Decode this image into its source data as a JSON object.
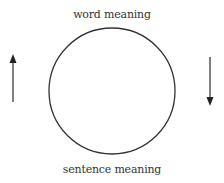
{
  "diagram": {
    "top_label": "word meaning",
    "bottom_label": "sentence meaning",
    "circle": {
      "cx": 112,
      "cy": 91,
      "r": 63,
      "stroke": "#333333"
    },
    "left_arrow": {
      "direction": "up",
      "x": 13,
      "y_tip": 55,
      "y_tail": 102,
      "color": "#333333"
    },
    "right_arrow": {
      "direction": "down",
      "x": 210,
      "y_tail": 57,
      "y_tip": 105,
      "color": "#333333"
    }
  }
}
